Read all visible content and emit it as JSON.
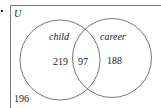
{
  "diagram": {
    "type": "venn",
    "universe_label": "U",
    "sets": [
      {
        "name": "child",
        "only_count": "219"
      },
      {
        "name": "career",
        "only_count": "188"
      }
    ],
    "intersection_count": "97",
    "outside_count": "196",
    "colors": {
      "line": "#555555",
      "text": "#222222",
      "background": "#ffffff"
    }
  }
}
